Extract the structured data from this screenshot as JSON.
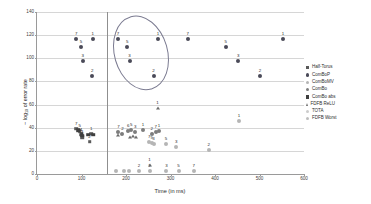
{
  "chart_data": {
    "type": "scatter",
    "title": "",
    "xlabel": "Time (in ms)",
    "ylabel": "− log10 of error rate",
    "ylabel_prefix": "− log",
    "ylabel_sub": "10",
    "ylabel_suffix": " of error rate",
    "xlim": [
      0,
      600
    ],
    "ylim": [
      0,
      140
    ],
    "xticks": [
      0,
      100,
      200,
      300,
      400,
      500,
      600
    ],
    "yticks": [
      0,
      20,
      40,
      60,
      80,
      100,
      120,
      140
    ],
    "grid": "horizontal",
    "legend_position": "right",
    "annotations": [
      {
        "name": "highlight-ellipse",
        "shape": "ellipse",
        "x_center": 232,
        "y_center": 105,
        "x_radius": 58,
        "y_radius": 32,
        "rotation_deg": -16
      },
      {
        "name": "vertical-divider",
        "shape": "vline",
        "x": 158
      }
    ],
    "series": [
      {
        "name": "Half-Torus",
        "marker": "square",
        "color": "#5a5a5a",
        "points": [
          {
            "x": 88,
            "y": 39,
            "label": "7"
          },
          {
            "x": 96,
            "y": 37,
            "label": "5"
          },
          {
            "x": 99,
            "y": 34,
            "label": "4"
          },
          {
            "x": 101,
            "y": 32,
            "label": "3"
          },
          {
            "x": 122,
            "y": 35,
            "label": "1"
          },
          {
            "x": 118,
            "y": 28,
            "label": "2"
          }
        ]
      },
      {
        "name": "ComBoP",
        "marker": "circle",
        "color": "#4a4a58",
        "points": [
          {
            "x": 88,
            "y": 117,
            "label": "7"
          },
          {
            "x": 99,
            "y": 110,
            "label": "5"
          },
          {
            "x": 103,
            "y": 98,
            "label": "3"
          },
          {
            "x": 125,
            "y": 117,
            "label": "1"
          },
          {
            "x": 124,
            "y": 85,
            "label": "2"
          },
          {
            "x": 182,
            "y": 117,
            "label": "7"
          },
          {
            "x": 203,
            "y": 110,
            "label": "5"
          },
          {
            "x": 208,
            "y": 98,
            "label": "3"
          },
          {
            "x": 272,
            "y": 117,
            "label": "1"
          },
          {
            "x": 262,
            "y": 85,
            "label": "2"
          },
          {
            "x": 339,
            "y": 117,
            "label": "7"
          },
          {
            "x": 424,
            "y": 110,
            "label": "5"
          },
          {
            "x": 452,
            "y": 98,
            "label": "3"
          },
          {
            "x": 501,
            "y": 85,
            "label": "2"
          },
          {
            "x": 553,
            "y": 117,
            "label": "1"
          }
        ]
      },
      {
        "name": "ComBoMV",
        "marker": "circle",
        "color": "#b5b5b5",
        "points": [
          {
            "x": 252,
            "y": 28,
            "label": "7"
          },
          {
            "x": 258,
            "y": 27,
            "label": "5"
          },
          {
            "x": 262,
            "y": 26,
            "label": "3"
          },
          {
            "x": 290,
            "y": 26,
            "label": "5"
          },
          {
            "x": 313,
            "y": 23,
            "label": "3"
          },
          {
            "x": 386,
            "y": 21,
            "label": "2"
          },
          {
            "x": 454,
            "y": 46,
            "label": "1"
          },
          {
            "x": 229,
            "y": 3,
            "label": "2"
          },
          {
            "x": 253,
            "y": 3,
            "label": "1"
          },
          {
            "x": 291,
            "y": 3,
            "label": "3"
          },
          {
            "x": 318,
            "y": 3,
            "label": "5"
          },
          {
            "x": 352,
            "y": 3,
            "label": "7"
          },
          {
            "x": 178,
            "y": 3,
            "label": ""
          },
          {
            "x": 196,
            "y": 3,
            "label": ""
          },
          {
            "x": 207,
            "y": 3,
            "label": ""
          }
        ]
      },
      {
        "name": "ComBo",
        "marker": "circle",
        "color": "#7d7d7d",
        "points": [
          {
            "x": 183,
            "y": 36,
            "label": "7"
          },
          {
            "x": 192,
            "y": 35,
            "label": "2"
          },
          {
            "x": 205,
            "y": 37,
            "label": "6"
          },
          {
            "x": 212,
            "y": 38,
            "label": "5"
          },
          {
            "x": 221,
            "y": 36,
            "label": "3"
          },
          {
            "x": 238,
            "y": 38,
            "label": "1"
          },
          {
            "x": 258,
            "y": 35,
            "label": "2"
          },
          {
            "x": 267,
            "y": 36,
            "label": "7"
          },
          {
            "x": 274,
            "y": 37,
            "label": "1"
          }
        ]
      },
      {
        "name": "ComBo abs",
        "marker": "square",
        "color": "#3f3f3f",
        "points": [
          {
            "x": 93,
            "y": 38,
            "label": ""
          },
          {
            "x": 100,
            "y": 35,
            "label": ""
          },
          {
            "x": 102,
            "y": 33,
            "label": ""
          },
          {
            "x": 115,
            "y": 34,
            "label": ""
          },
          {
            "x": 126,
            "y": 34,
            "label": ""
          }
        ]
      },
      {
        "name": "FDFB ReLU",
        "marker": "triangle",
        "color": "#6b6b6b",
        "points": [
          {
            "x": 271,
            "y": 57,
            "label": "1"
          },
          {
            "x": 183,
            "y": 34,
            "label": ""
          },
          {
            "x": 210,
            "y": 32,
            "label": ""
          },
          {
            "x": 216,
            "y": 33,
            "label": ""
          },
          {
            "x": 223,
            "y": 32,
            "label": ""
          },
          {
            "x": 253,
            "y": 8,
            "label": "1"
          }
        ]
      },
      {
        "name": "TOTA",
        "marker": "circle",
        "color": "#cccccc",
        "points": []
      },
      {
        "name": "FDFB Worst",
        "marker": "circle",
        "color": "#bdbdbd",
        "points": []
      }
    ]
  },
  "legend": {
    "items": [
      {
        "label": "Half-Torus",
        "marker": "square",
        "color": "#5a5a5a"
      },
      {
        "label": "ComBoP",
        "marker": "circle",
        "color": "#4a4a58"
      },
      {
        "label": "ComBoMV",
        "marker": "circle",
        "color": "#b5b5b5"
      },
      {
        "label": "ComBo",
        "marker": "circle",
        "color": "#7d7d7d"
      },
      {
        "label": "ComBo abs",
        "marker": "square",
        "color": "#3f3f3f"
      },
      {
        "label": "FDFB ReLU",
        "marker": "triangle",
        "color": "#6b6b6b"
      },
      {
        "label": "TOTA",
        "marker": "circle",
        "color": "#cccccc"
      },
      {
        "label": "FDFB Worst",
        "marker": "circle",
        "color": "#bdbdbd"
      }
    ]
  }
}
